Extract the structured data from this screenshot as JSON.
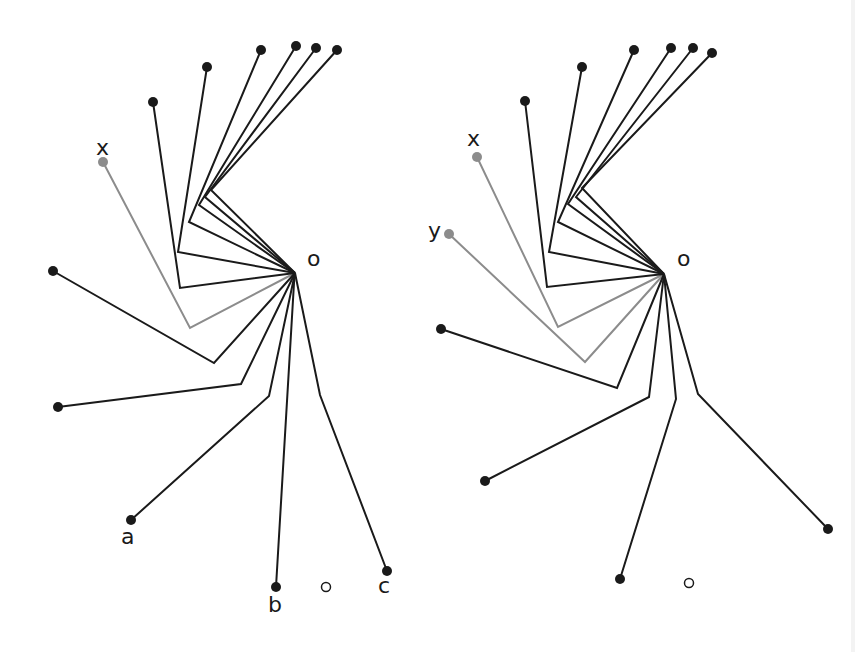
{
  "figure": {
    "colors": {
      "black": "#1a1a1a",
      "gray": "#8c8c8c",
      "open": "#1a1a1a"
    },
    "panels": [
      {
        "name": "left-panel",
        "origin": {
          "label": "o",
          "x": 295,
          "y": 273,
          "label_x": 307,
          "label_y": 266
        },
        "paths": [
          {
            "end": [
              153,
              102
            ],
            "bend": [
              180,
              288
            ],
            "color": "black"
          },
          {
            "end": [
              207,
              67
            ],
            "bend": [
              178,
              252
            ],
            "color": "black"
          },
          {
            "end": [
              261,
              50
            ],
            "bend": [
              189,
              222
            ],
            "color": "black"
          },
          {
            "end": [
              296,
              46
            ],
            "bend": [
              199,
              205
            ],
            "color": "black"
          },
          {
            "end": [
              316,
              48
            ],
            "bend": [
              205,
              197
            ],
            "color": "black"
          },
          {
            "end": [
              337,
              50
            ],
            "bend": [
              211,
              190
            ],
            "color": "black"
          },
          {
            "end": [
              103,
              162
            ],
            "bend": [
              190,
              328
            ],
            "color": "gray",
            "label": "x",
            "label_x": 96,
            "label_y": 155
          },
          {
            "end": [
              53,
              271
            ],
            "bend": [
              214,
              363
            ],
            "color": "black"
          },
          {
            "end": [
              58,
              407
            ],
            "bend": [
              241,
              384
            ],
            "color": "black"
          },
          {
            "end": [
              131,
              520
            ],
            "bend": [
              269,
              396
            ],
            "color": "black",
            "label": "a",
            "label_x": 121,
            "label_y": 544
          },
          {
            "end": [
              276,
              587
            ],
            "bend": [
              294,
              283
            ],
            "color": "black",
            "label": "b",
            "label_x": 268,
            "label_y": 612
          },
          {
            "end": [
              387,
              571
            ],
            "bend": [
              320,
              395
            ],
            "color": "black",
            "label": "c",
            "label_x": 378,
            "label_y": 593
          }
        ],
        "open_circle": {
          "x": 326,
          "y": 587
        }
      },
      {
        "name": "right-panel",
        "origin": {
          "label": "o",
          "x": 664,
          "y": 274,
          "label_x": 677,
          "label_y": 266
        },
        "paths": [
          {
            "end": [
              525,
              101
            ],
            "bend": [
              547,
              287
            ],
            "color": "black"
          },
          {
            "end": [
              582,
              67
            ],
            "bend": [
              549,
              252
            ],
            "color": "black"
          },
          {
            "end": [
              634,
              50
            ],
            "bend": [
              558,
              222
            ],
            "color": "black"
          },
          {
            "end": [
              671,
              48
            ],
            "bend": [
              568,
              204
            ],
            "color": "black"
          },
          {
            "end": [
              693,
              48
            ],
            "bend": [
              576,
              197
            ],
            "color": "black"
          },
          {
            "end": [
              712,
              53
            ],
            "bend": [
              582,
              188
            ],
            "color": "black"
          },
          {
            "end": [
              477,
              157
            ],
            "bend": [
              558,
              327
            ],
            "color": "gray",
            "label": "x",
            "label_x": 467,
            "label_y": 146
          },
          {
            "end": [
              449,
              234
            ],
            "bend": [
              585,
              362
            ],
            "color": "gray",
            "label": "y",
            "label_x": 428,
            "label_y": 238
          },
          {
            "end": [
              441,
              329
            ],
            "bend": [
              617,
              388
            ],
            "color": "black"
          },
          {
            "end": [
              485,
              481
            ],
            "bend": [
              649,
              397
            ],
            "color": "black"
          },
          {
            "end": [
              620,
              579
            ],
            "bend": [
              676,
              399
            ],
            "color": "black"
          },
          {
            "end": [
              828,
              529
            ],
            "bend": [
              698,
              394
            ],
            "color": "black"
          }
        ],
        "open_circle": {
          "x": 689,
          "y": 583
        }
      }
    ]
  }
}
